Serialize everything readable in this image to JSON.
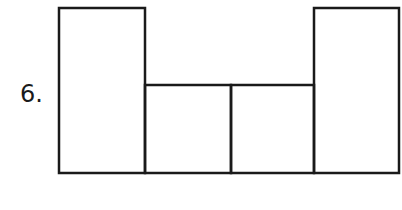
{
  "problem": {
    "number_label": "6."
  },
  "figure": {
    "stroke_color": "#1a1a1a",
    "stroke_width": 2.5,
    "shapes": [
      {
        "name": "left-tall-rectangle",
        "x": 59,
        "y": 8,
        "w": 86,
        "h": 165
      },
      {
        "name": "center-left-square",
        "x": 145,
        "y": 85,
        "w": 86,
        "h": 88
      },
      {
        "name": "center-right-square",
        "x": 231,
        "y": 85,
        "w": 83,
        "h": 88
      },
      {
        "name": "right-tall-rectangle",
        "x": 314,
        "y": 8,
        "w": 85,
        "h": 165
      }
    ]
  }
}
